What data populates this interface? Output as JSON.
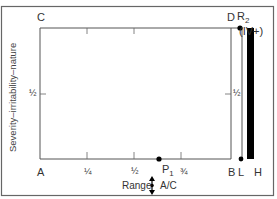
{
  "diagram": {
    "corner_labels": {
      "top_left": "C",
      "bottom_left": "A",
      "top_right": "D",
      "bottom_right": "B"
    },
    "y_axis": {
      "label": "Severity–irritability–nature",
      "mid_tick_label": "½"
    },
    "right_axis": {
      "mid_tick_label": "½"
    },
    "x_axis": {
      "tick_labels": [
        "¼",
        "½",
        "¾"
      ],
      "label": "Range",
      "label_suffix": "A/C"
    },
    "points": {
      "p1": {
        "label": "P",
        "subscript": "1"
      },
      "r2": {
        "label": "R",
        "subscript": "2",
        "suffix": "(IV+)"
      }
    },
    "right_labels": {
      "limit": "L",
      "hard": "H"
    },
    "colors": {
      "line": "#555555",
      "bar": "#000000",
      "background": "#ffffff"
    }
  }
}
